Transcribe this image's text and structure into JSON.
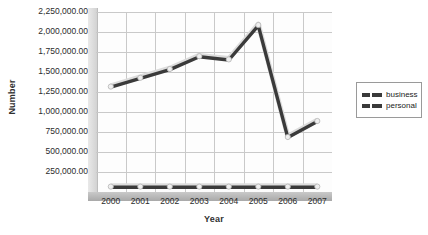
{
  "chart_data": {
    "type": "line",
    "title": "",
    "xlabel": "Year",
    "ylabel": "Number",
    "categories": [
      "2000",
      "2001",
      "2002",
      "2003",
      "2004",
      "2005",
      "2006",
      "2007"
    ],
    "series": [
      {
        "name": "business",
        "color": "#3a3a3a",
        "values": [
          1310000,
          1420000,
          1530000,
          1690000,
          1650000,
          2080000,
          680000,
          880000
        ]
      },
      {
        "name": "personal",
        "color": "#3a3a3a",
        "values": [
          60000,
          60000,
          60000,
          60000,
          60000,
          60000,
          60000,
          60000
        ]
      }
    ],
    "ylim": [
      0,
      2250000
    ],
    "ytick_values": [
      0,
      250000,
      500000,
      750000,
      1000000,
      1250000,
      1500000,
      1750000,
      2000000,
      2250000
    ],
    "ytick_labels": [
      "",
      "250,000.00",
      "500,000.00",
      "750,000.00",
      "1,000,000.00",
      "1,250,000.00",
      "1,500,000.00",
      "1,750,000.00",
      "2,000,000.00",
      "2,250,000.00"
    ],
    "grid": true,
    "legend_position": "right",
    "legend_entries": [
      "business",
      "personal"
    ]
  }
}
